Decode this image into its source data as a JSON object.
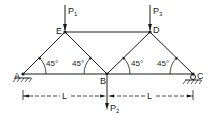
{
  "diagram": {
    "type": "truss",
    "nodes": {
      "A": {
        "label": "A"
      },
      "B": {
        "label": "B"
      },
      "C": {
        "label": "C"
      },
      "D": {
        "label": "D"
      },
      "E": {
        "label": "E"
      }
    },
    "loads": {
      "P1": {
        "label": "P",
        "sub": "1",
        "node": "E",
        "direction": "down"
      },
      "P2": {
        "label": "P",
        "sub": "2",
        "node": "B",
        "direction": "down"
      },
      "P3": {
        "label": "P",
        "sub": "3",
        "node": "D",
        "direction": "down"
      }
    },
    "angles": [
      "45°",
      "45°",
      "45°",
      "45°"
    ],
    "dimensions": [
      {
        "label": "L",
        "from": "A",
        "to": "B"
      },
      {
        "label": "L",
        "from": "B",
        "to": "C"
      }
    ],
    "supports": {
      "A": "pin",
      "C": "roller"
    },
    "members": [
      "A-E",
      "E-B",
      "B-D",
      "D-C",
      "E-D",
      "A-B",
      "B-C"
    ]
  }
}
